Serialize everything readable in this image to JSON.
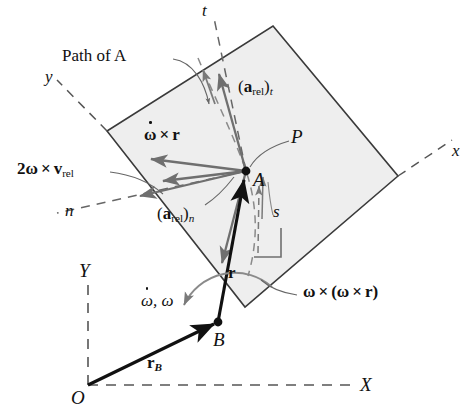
{
  "figure": {
    "colors": {
      "plate_fill": "#eeeeee",
      "plate_stroke": "#3a3a3a",
      "relative_vector": "#6f6f6f",
      "absolute_vector": "#111111",
      "axis_dash": "#555555",
      "leader": "#666666",
      "text": "#111111"
    }
  },
  "labels": {
    "path_of_a": "Path of A",
    "a_rel_t": {
      "prefix": "(",
      "symbol": "a",
      "sub1": "rel",
      "mid": ")",
      "sub2": "t"
    },
    "a_rel_n": {
      "prefix": "(",
      "symbol": "a",
      "sub1": "rel",
      "mid": ")",
      "sub2": "n"
    },
    "omega_dot_cross_r": {
      "omega": "ω",
      "op": "×",
      "r": "r"
    },
    "two_omega_cross_vrel": {
      "two": "2",
      "omega": "ω",
      "op": "×",
      "v": "v",
      "sub": "rel"
    },
    "omega_cross_omega_cross_r": {
      "omega": "ω",
      "op": "×",
      "open": "(",
      "omega2": "ω",
      "op2": "×",
      "r": "r",
      "close": ")"
    },
    "omega_dot_omega": {
      "omega_dot": "ω",
      "comma": ", ",
      "omega": "ω"
    },
    "r_vector": "r",
    "r_b_vector": {
      "symbol": "r",
      "sub": "B"
    },
    "point_a": "A",
    "point_b": "B",
    "point_p": "P",
    "point_o": "O",
    "arc_length_s": "s",
    "axis_t": "t",
    "axis_n": "n",
    "axis_x_body": "x",
    "axis_y_body": "y",
    "axis_X_global": "X",
    "axis_Y_global": "Y"
  },
  "geometry": {
    "point_A": {
      "x": 246,
      "y": 171
    },
    "point_B": {
      "x": 218,
      "y": 322
    },
    "point_O": {
      "x": 88,
      "y": 385
    },
    "plate_corners": [
      {
        "x": 273,
        "y": 26
      },
      {
        "x": 398,
        "y": 176
      },
      {
        "x": 245,
        "y": 307
      },
      {
        "x": 107,
        "y": 131
      }
    ]
  }
}
